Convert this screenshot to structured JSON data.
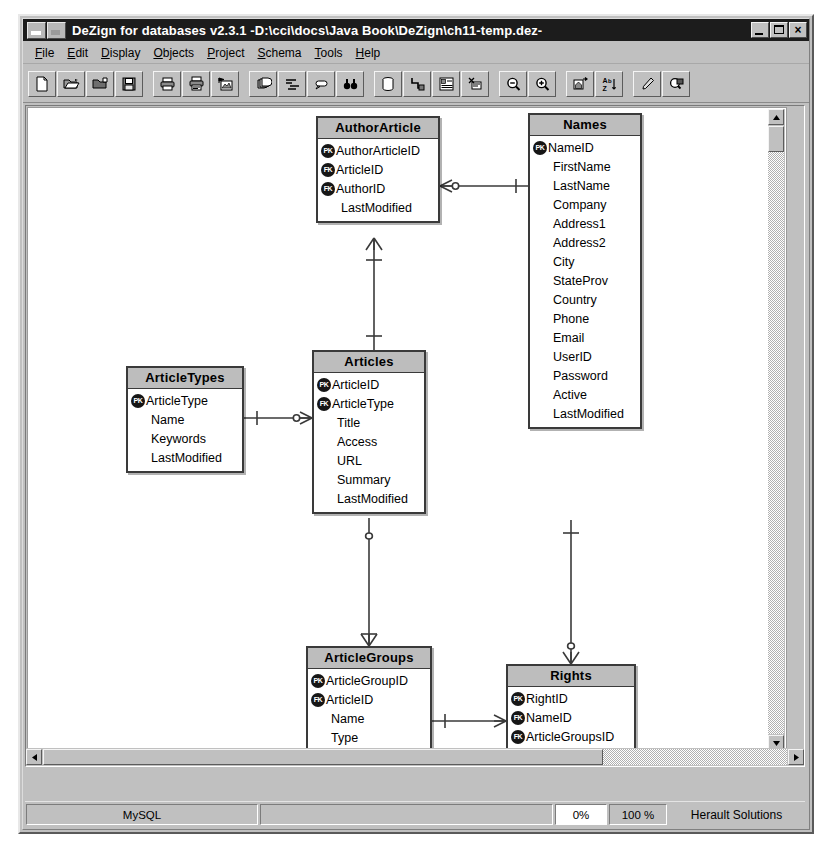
{
  "window": {
    "title": "DeZign for databases v2.3.1  -D:\\cci\\docs\\Java Book\\DeZign\\ch11-temp.dez-",
    "minimize_label": "Minimize",
    "maximize_label": "Maximize",
    "close_label": "×"
  },
  "menu": [
    {
      "label": "File",
      "hotkey": "F"
    },
    {
      "label": "Edit",
      "hotkey": "E"
    },
    {
      "label": "Display",
      "hotkey": "D"
    },
    {
      "label": "Objects",
      "hotkey": "O"
    },
    {
      "label": "Project",
      "hotkey": "P"
    },
    {
      "label": "Schema",
      "hotkey": "S"
    },
    {
      "label": "Tools",
      "hotkey": "T"
    },
    {
      "label": "Help",
      "hotkey": "H"
    }
  ],
  "toolbar": {
    "groups": [
      [
        "new-document-icon",
        "open-folder-icon",
        "save-as-folder-icon",
        "save-disk-icon"
      ],
      [
        "print-icon",
        "print-preview-icon",
        "export-image-icon"
      ],
      [
        "layers-icon",
        "align-icon",
        "note-icon",
        "find-binoculars-icon"
      ],
      [
        "database-icon",
        "relation-icon",
        "entity-icon",
        "cut-entity-icon"
      ],
      [
        "zoom-out-icon",
        "zoom-in-icon"
      ],
      [
        "home-view-icon",
        "sort-az-icon"
      ],
      [
        "pen-icon",
        "select-region-icon"
      ]
    ]
  },
  "erd": {
    "entities": [
      {
        "id": "authorarticle",
        "name": "AuthorArticle",
        "x": 288,
        "y": 8,
        "w": 124,
        "attributes": [
          {
            "key": "PK",
            "name": "AuthorArticleID"
          },
          {
            "key": "FK",
            "name": "ArticleID"
          },
          {
            "key": "FK",
            "name": "AuthorID"
          },
          {
            "key": "",
            "name": "LastModified"
          }
        ]
      },
      {
        "id": "names",
        "name": "Names",
        "x": 500,
        "y": 5,
        "w": 114,
        "attributes": [
          {
            "key": "PK",
            "name": "NameID"
          },
          {
            "key": "",
            "name": "FirstName"
          },
          {
            "key": "",
            "name": "LastName"
          },
          {
            "key": "",
            "name": "Company"
          },
          {
            "key": "",
            "name": "Address1"
          },
          {
            "key": "",
            "name": "Address2"
          },
          {
            "key": "",
            "name": "City"
          },
          {
            "key": "",
            "name": "StateProv"
          },
          {
            "key": "",
            "name": "Country"
          },
          {
            "key": "",
            "name": "Phone"
          },
          {
            "key": "",
            "name": "Email"
          },
          {
            "key": "",
            "name": "UserID"
          },
          {
            "key": "",
            "name": "Password"
          },
          {
            "key": "",
            "name": "Active"
          },
          {
            "key": "",
            "name": "LastModified"
          }
        ]
      },
      {
        "id": "articletypes",
        "name": "ArticleTypes",
        "x": 98,
        "y": 258,
        "w": 118,
        "attributes": [
          {
            "key": "PK",
            "name": "ArticleType"
          },
          {
            "key": "",
            "name": "Name"
          },
          {
            "key": "",
            "name": "Keywords"
          },
          {
            "key": "",
            "name": "LastModified"
          }
        ]
      },
      {
        "id": "articles",
        "name": "Articles",
        "x": 284,
        "y": 242,
        "w": 114,
        "attributes": [
          {
            "key": "PK",
            "name": "ArticleID"
          },
          {
            "key": "FK",
            "name": "ArticleType"
          },
          {
            "key": "",
            "name": "Title"
          },
          {
            "key": "",
            "name": "Access"
          },
          {
            "key": "",
            "name": "URL"
          },
          {
            "key": "",
            "name": "Summary"
          },
          {
            "key": "",
            "name": "LastModified"
          }
        ]
      },
      {
        "id": "articlegroups",
        "name": "ArticleGroups",
        "x": 278,
        "y": 538,
        "w": 126,
        "attributes": [
          {
            "key": "PK",
            "name": "ArticleGroupID"
          },
          {
            "key": "FK",
            "name": "ArticleID"
          },
          {
            "key": "",
            "name": "Name"
          },
          {
            "key": "",
            "name": "Type"
          },
          {
            "key": "",
            "name": "LastModified"
          }
        ]
      },
      {
        "id": "rights",
        "name": "Rights",
        "x": 478,
        "y": 556,
        "w": 130,
        "attributes": [
          {
            "key": "PK",
            "name": "RightID"
          },
          {
            "key": "FK",
            "name": "NameID"
          },
          {
            "key": "FK",
            "name": "ArticleGroupsID"
          },
          {
            "key": "",
            "name": "LastModified"
          }
        ]
      }
    ],
    "relationships": [
      {
        "from": "authorarticle",
        "to": "names",
        "notation": "many-to-one"
      },
      {
        "from": "authorarticle",
        "to": "articles",
        "notation": "many-to-one"
      },
      {
        "from": "articletypes",
        "to": "articles",
        "notation": "one-to-many"
      },
      {
        "from": "articles",
        "to": "articlegroups",
        "notation": "one-to-many"
      },
      {
        "from": "names",
        "to": "rights",
        "notation": "one-to-many"
      },
      {
        "from": "articlegroups",
        "to": "rights",
        "notation": "one-to-many"
      }
    ]
  },
  "scrollbars": {
    "vertical": {
      "up_label": "▲",
      "down_label": "▼"
    },
    "horizontal": {
      "left_label": "◄",
      "right_label": "►"
    }
  },
  "statusbar": {
    "database": "MySQL",
    "blank": "",
    "progress": "0%",
    "zoom": "100 %",
    "vendor": "Herault Solutions"
  }
}
